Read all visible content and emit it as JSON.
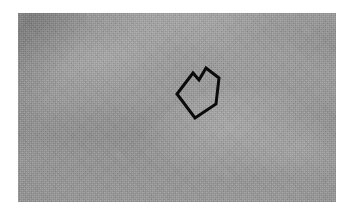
{
  "figure": {
    "kind": "grayscale-photograph",
    "caption_text": "",
    "background_color": "#ffffff",
    "plate": {
      "left_px": 18,
      "top_px": 13,
      "width_px": 318,
      "height_px": 189,
      "base_color": "#9e9e9e",
      "light_tone": "#c4c4c4",
      "dark_tone": "#6f6f6f",
      "description": "Mottled grey cloudy texture; darker diagonal streak in the upper-left, a dark horizontal band across the middle, and a brighter rough dome-like mound occupying the centre-right and lower-right."
    },
    "annotations": [
      {
        "name": "arrow-marker",
        "type": "outlined-arrow",
        "color": "#0b0b0b",
        "stroke_width_px": 3,
        "points": "24,62 40,41 46,48 53,36 66,46 63,72 42,86",
        "direction": "down-left",
        "label": ""
      }
    ],
    "regions": [
      {
        "name": "upper-cloud-field",
        "tone": "light-grey"
      },
      {
        "name": "dark-diagonal-streak",
        "tone": "dark-grey"
      },
      {
        "name": "mid-dark-band",
        "tone": "mid-grey"
      },
      {
        "name": "bright-mound",
        "tone": "light-grey"
      }
    ]
  }
}
